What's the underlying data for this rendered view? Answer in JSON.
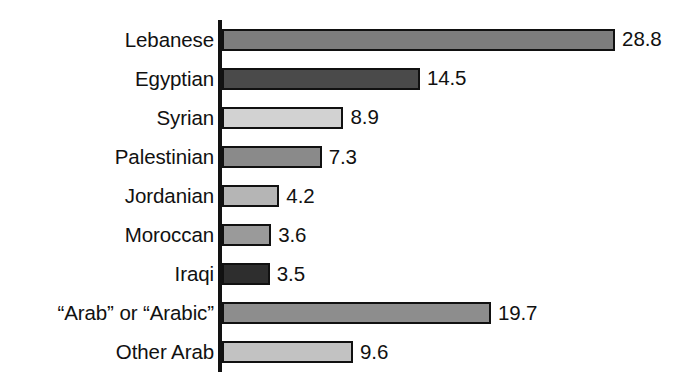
{
  "chart_data": {
    "type": "bar",
    "orientation": "horizontal",
    "title": "",
    "subtitle": "",
    "xlabel": "",
    "ylabel": "",
    "grid": false,
    "legend": "none",
    "axis_line": true,
    "xlim": [
      0,
      28.8
    ],
    "px_per_unit": 13.65,
    "categories": [
      "Lebanese",
      "Egyptian",
      "Syrian",
      "Palestinian",
      "Jordanian",
      "Moroccan",
      "Iraqi",
      "“Arab” or “Arabic”",
      "Other Arab"
    ],
    "values": [
      28.8,
      14.5,
      8.9,
      7.3,
      4.2,
      3.6,
      3.5,
      19.7,
      9.6
    ],
    "value_labels": [
      "28.8",
      "14.5",
      "8.9",
      "7.3",
      "4.2",
      "3.6",
      "3.5",
      "19.7",
      "9.6"
    ],
    "bar_colors": [
      "#7d7d7d",
      "#4a4a4a",
      "#d2d2d2",
      "#8a8a8a",
      "#b5b5b5",
      "#9a9a9a",
      "#2e2e2e",
      "#8d8d8d",
      "#c2c2c2"
    ],
    "bar_border_color": "#111111",
    "axis_color": "#121212",
    "text_color": "#111111",
    "background": "#ffffff"
  }
}
